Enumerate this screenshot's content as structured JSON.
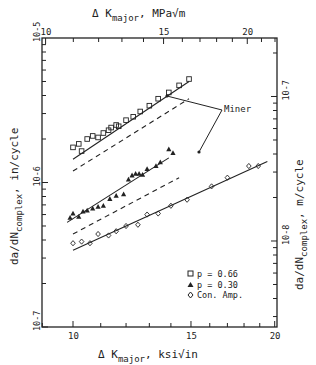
{
  "chart_data": {
    "type": "scatter",
    "title": "",
    "top_xlabel": "Δ K_major, MPa√m",
    "xlabel": "Δ K_major, ksi√in",
    "ylabel": "da/dN_complex, in/cycle",
    "right_ylabel": "da/dN_complex, m/cycle",
    "x_scale": "log",
    "y_scale": "log",
    "xlim": [
      8.35,
      20.0
    ],
    "ylim": [
      1e-07,
      1e-05
    ],
    "x_ticks_bottom": [
      "10",
      "15",
      "20"
    ],
    "x_ticks_top": [
      "10",
      "15",
      "20"
    ],
    "y_ticks_left": [
      "10^-5",
      "10^-6",
      "10^-7"
    ],
    "y_ticks_right": [
      "10^-7",
      "10^-8"
    ],
    "grid": false,
    "legend_position": "lower right inside",
    "legend": [
      {
        "marker": "□",
        "label": "p = 0.66"
      },
      {
        "marker": "▲",
        "label": "p = 0.30"
      },
      {
        "marker": "◇",
        "label": "Con. Amp."
      }
    ],
    "annotations": [
      {
        "text": "Miner",
        "points_to": [
          "dashed line p=0.66 end",
          "dashed line p=0.30 end"
        ]
      }
    ],
    "series": [
      {
        "name": "p = 0.66",
        "marker": "square",
        "x": [
          10.0,
          10.2,
          10.3,
          10.5,
          10.7,
          10.9,
          11.1,
          11.3,
          11.4,
          11.6,
          11.7,
          12.0,
          12.3,
          12.6,
          13.0,
          13.4,
          13.9,
          14.4,
          14.9
        ],
        "y": [
          1.75e-06,
          1.85e-06,
          1.65e-06,
          2e-06,
          2.1e-06,
          2.05e-06,
          2.2e-06,
          2.3e-06,
          2.4e-06,
          2.5e-06,
          2.45e-06,
          2.7e-06,
          2.85e-06,
          3.1e-06,
          3.4e-06,
          3.8e-06,
          4.2e-06,
          4.7e-06,
          5.2e-06
        ]
      },
      {
        "name": "p = 0.30",
        "marker": "triangle",
        "x": [
          9.9,
          10.0,
          10.2,
          10.35,
          10.5,
          10.7,
          10.9,
          11.1,
          11.35,
          11.6,
          11.9,
          12.1,
          12.25,
          12.4,
          12.55,
          12.7,
          12.9,
          13.3,
          13.5,
          13.9,
          14.1
        ],
        "y": [
          5.7e-07,
          6.1e-07,
          5.8e-07,
          6.3e-07,
          6.4e-07,
          6.6e-07,
          6.8e-07,
          6.9e-07,
          7.7e-07,
          8.1e-07,
          8.3e-07,
          1.05e-06,
          1.12e-06,
          1.15e-06,
          1.15e-06,
          1.13e-06,
          1.24e-06,
          1.3e-06,
          1.38e-06,
          1.7e-06,
          1.6e-06
        ]
      },
      {
        "name": "Con. Amp.",
        "marker": "diamond",
        "x": [
          10.0,
          10.3,
          10.6,
          10.9,
          11.3,
          11.6,
          12.0,
          12.5,
          12.9,
          13.4,
          14.0,
          14.8,
          16.1,
          17.0,
          18.3,
          18.9
        ],
        "y": [
          3.8e-07,
          3.9e-07,
          3.8e-07,
          4.4e-07,
          4.3e-07,
          4.6e-07,
          5e-07,
          5.1e-07,
          6e-07,
          6.1e-07,
          6.9e-07,
          7.6e-07,
          9.4e-07,
          1.08e-06,
          1.3e-06,
          1.3e-06
        ]
      }
    ],
    "fit_lines": [
      {
        "name": "p = 0.66 fit",
        "style": "solid",
        "x": [
          10.0,
          14.9
        ],
        "y": [
          1.45e-06,
          5e-06
        ]
      },
      {
        "name": "p = 0.66 Miner",
        "style": "dashed",
        "x": [
          10.0,
          14.9
        ],
        "y": [
          1.2e-06,
          3.8e-06
        ]
      },
      {
        "name": "p = 0.30 fit",
        "style": "solid",
        "x": [
          9.8,
          13.9
        ],
        "y": [
          5.3e-07,
          1.48e-06
        ]
      },
      {
        "name": "p = 0.30 Miner",
        "style": "dashed",
        "x": [
          10.0,
          14.4
        ],
        "y": [
          4.4e-07,
          1.08e-06
        ]
      },
      {
        "name": "Con. Amp. fit",
        "style": "solid",
        "x": [
          10.0,
          19.5
        ],
        "y": [
          3.4e-07,
          1.4e-06
        ]
      }
    ]
  }
}
